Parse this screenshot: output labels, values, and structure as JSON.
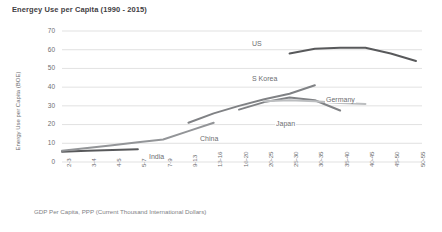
{
  "chart_data": {
    "type": "line",
    "title": "Energey Use per Capita (1990 - 2015)",
    "xlabel": "GDP Per Capita, PPP (Current Thousand International Dollars)",
    "ylabel": "Energy Use per Capita (BOE)",
    "ylim": [
      0,
      70
    ],
    "yticks": [
      0,
      10,
      20,
      30,
      40,
      50,
      60,
      70
    ],
    "grid": "horizontal",
    "legend": "inline-labels",
    "categories": [
      "2-3",
      "3-4",
      "4-5",
      "5-7",
      "7-9",
      "9-13",
      "13-16",
      "16-20",
      "20-25",
      "25-30",
      "30-35",
      "35-40",
      "40-45",
      "45-50",
      "50-55"
    ],
    "series": [
      {
        "name": "India",
        "color": "#58595b",
        "points": [
          {
            "x": "2-3",
            "y": 5.5
          },
          {
            "x": "3-4",
            "y": 6.0
          },
          {
            "x": "4-5",
            "y": 6.4
          },
          {
            "x": "5-7",
            "y": 6.8
          }
        ]
      },
      {
        "name": "China",
        "color": "#939598",
        "points": [
          {
            "x": "2-3",
            "y": 6.0
          },
          {
            "x": "3-4",
            "y": 7.5
          },
          {
            "x": "4-5",
            "y": 9.0
          },
          {
            "x": "5-7",
            "y": 10.5
          },
          {
            "x": "7-9",
            "y": 12.0
          },
          {
            "x": "9-13",
            "y": 16.5
          },
          {
            "x": "13-16",
            "y": 21.0
          }
        ]
      },
      {
        "name": "S Korea",
        "color": "#808285",
        "points": [
          {
            "x": "9-13",
            "y": 21.0
          },
          {
            "x": "13-16",
            "y": 26.0
          },
          {
            "x": "16-20",
            "y": 30.0
          },
          {
            "x": "20-25",
            "y": 33.5
          },
          {
            "x": "25-30",
            "y": 36.5
          },
          {
            "x": "30-35",
            "y": 41.0
          }
        ]
      },
      {
        "name": "Japan",
        "color": "#808285",
        "points": [
          {
            "x": "16-20",
            "y": 28.0
          },
          {
            "x": "20-25",
            "y": 32.0
          },
          {
            "x": "25-30",
            "y": 34.5
          },
          {
            "x": "30-35",
            "y": 33.0
          },
          {
            "x": "35-40",
            "y": 27.5
          }
        ]
      },
      {
        "name": "Germany",
        "color": "#bcbec0",
        "points": [
          {
            "x": "20-25",
            "y": 32.5
          },
          {
            "x": "25-30",
            "y": 33.0
          },
          {
            "x": "30-35",
            "y": 32.5
          },
          {
            "x": "35-40",
            "y": 31.5
          },
          {
            "x": "40-45",
            "y": 31.0
          }
        ]
      },
      {
        "name": "US",
        "color": "#58595b",
        "points": [
          {
            "x": "25-30",
            "y": 58.0
          },
          {
            "x": "30-35",
            "y": 60.5
          },
          {
            "x": "35-40",
            "y": 61.0
          },
          {
            "x": "40-45",
            "y": 61.0
          },
          {
            "x": "45-50",
            "y": 58.0
          },
          {
            "x": "50-55",
            "y": 54.0
          }
        ]
      }
    ],
    "series_label_positions": [
      {
        "name": "US",
        "left": 251,
        "top": 40
      },
      {
        "name": "S Korea",
        "left": 251,
        "top": 75
      },
      {
        "name": "Germany",
        "left": 325,
        "top": 96
      },
      {
        "name": "Japan",
        "left": 275,
        "top": 120
      },
      {
        "name": "China",
        "left": 199,
        "top": 135
      },
      {
        "name": "India",
        "left": 148,
        "top": 153
      }
    ]
  },
  "colors": {
    "background": "#ffffff",
    "gridline": "#d9d9d9",
    "axis_text": "#6d6e71",
    "title_text": "#3f4043"
  }
}
